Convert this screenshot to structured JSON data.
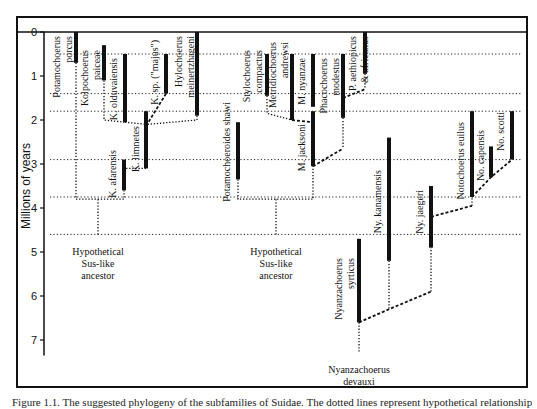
{
  "figure": {
    "caption": "Figure 1.1. The suggested phylogeny of the subfamilies of Suidae. The dotted lines represent hypothetical relationships; the solid bars represent known temporal ranges.",
    "y_axis": {
      "label": "Millions of years",
      "ticks": [
        0,
        1,
        2,
        3,
        4,
        5,
        6,
        7
      ],
      "range": [
        0,
        7.5
      ],
      "px_per_myr": 44,
      "y0_px": 32,
      "x_px": 44
    },
    "frame": {
      "left": 17,
      "top": 17,
      "right": 527,
      "bottom": 387,
      "inner_top": 32
    },
    "colors": {
      "ink": "#111111",
      "background": "#ffffff",
      "dotted": "#222222"
    },
    "reference_levels_myr": [
      0.5,
      1.4,
      1.8,
      2.9,
      3.75,
      4.6
    ],
    "taxa": [
      {
        "id": "potamochoerus-porcus",
        "label": [
          "Potamochoerus",
          "porcus"
        ],
        "x": 76,
        "start": 0.0,
        "end": 0.7,
        "label_x": 60,
        "label_y": 36
      },
      {
        "id": "kolpochoerus-paiceae",
        "label": [
          "Kolpochoerus",
          "paiceae"
        ],
        "x": 104,
        "start": 0.3,
        "end": 1.1,
        "label_x": 88,
        "label_y": 50
      },
      {
        "id": "k-olduvaiensis",
        "label": [
          "K. olduvaiensis"
        ],
        "x": 125,
        "start": 0.5,
        "end": 2.05,
        "label_x": 117,
        "label_y": 58
      },
      {
        "id": "k-sp-majus",
        "label": [
          "K. sp. (\"majus\")"
        ],
        "x": 166,
        "start": 0.5,
        "end": 1.4,
        "label_x": 158,
        "label_y": 40
      },
      {
        "id": "hylochoerus-meinertzhageni",
        "label": [
          "Hylochoerus",
          "meinertzhageni"
        ],
        "x": 197,
        "start": 0.0,
        "end": 1.9,
        "label_x": 182,
        "label_y": 36
      },
      {
        "id": "k-limnetes",
        "label": [
          "K. limnetes"
        ],
        "x": 146,
        "start": 1.8,
        "end": 3.1,
        "label_x": 139,
        "label_y": 126
      },
      {
        "id": "k-afarensis",
        "label": [
          "K. afarensis"
        ],
        "x": 124,
        "start": 2.9,
        "end": 3.6,
        "label_x": 116,
        "label_y": 150
      },
      {
        "id": "potamochoeroides-shawi",
        "label": [
          "Potamochoeroides shawi"
        ],
        "x": 238,
        "start": 2.05,
        "end": 3.35,
        "label_x": 230,
        "label_y": 102
      },
      {
        "id": "stylochoerus-compactus",
        "label": [
          "Stylochoerus",
          "compactus"
        ],
        "x": 267,
        "start": 0.5,
        "end": 1.45,
        "label_x": 250,
        "label_y": 50
      },
      {
        "id": "metridiochoerus-andrewsi",
        "label": [
          "Metridiochoerus",
          "andrewsi"
        ],
        "x": 292,
        "start": 0.5,
        "end": 2.0,
        "label_x": 276,
        "label_y": 42
      },
      {
        "id": "m-nyanzae",
        "label": [
          "M. nyanzae"
        ],
        "x": 313,
        "start": 0.5,
        "end": 1.7,
        "label_x": 305,
        "label_y": 58
      },
      {
        "id": "m-jacksoni",
        "label": [
          "M. jacksoni"
        ],
        "x": 313,
        "start": 1.8,
        "end": 3.05,
        "label_x": 305,
        "label_y": 124
      },
      {
        "id": "phacochoerus-modestus",
        "label": [
          "Phacochoerus",
          "modestus"
        ],
        "x": 343,
        "start": 0.5,
        "end": 1.95,
        "label_x": 327,
        "label_y": 58
      },
      {
        "id": "p-aethiopicus-africanus",
        "label": [
          "P. aethiopicus",
          "& africanus"
        ],
        "x": 365,
        "start": 0.0,
        "end": 0.95,
        "label_x": 356,
        "label_y": 36
      },
      {
        "id": "ny-kanamensis",
        "label": [
          "Ny. kanamensis"
        ],
        "x": 389,
        "start": 2.4,
        "end": 5.2,
        "label_x": 381,
        "label_y": 170
      },
      {
        "id": "ny-jaegeri",
        "label": [
          "Ny. jaegeri"
        ],
        "x": 431,
        "start": 3.5,
        "end": 4.9,
        "label_x": 423,
        "label_y": 190
      },
      {
        "id": "nyanzachoerus-syrticus",
        "label": [
          "Nyanzachoerus",
          "syrticus"
        ],
        "x": 359,
        "start": 4.7,
        "end": 6.6,
        "label_x": 342,
        "label_y": 258
      },
      {
        "id": "notochoerus-euilus",
        "label": [
          "Notochoerus euilus"
        ],
        "x": 472,
        "start": 1.8,
        "end": 3.75,
        "label_x": 464,
        "label_y": 122
      },
      {
        "id": "no-capensis",
        "label": [
          "No. capensis"
        ],
        "x": 491,
        "start": 2.6,
        "end": 3.3,
        "label_x": 484,
        "label_y": 130
      },
      {
        "id": "no-scotti",
        "label": [
          "No. scotti"
        ],
        "x": 512,
        "start": 1.8,
        "end": 2.9,
        "label_x": 504,
        "label_y": 112
      }
    ],
    "ancestors": [
      {
        "id": "sus-ancestor-left",
        "label": [
          "Hypothetical",
          "Sus-like",
          "ancestor"
        ],
        "x": 98,
        "y": 255
      },
      {
        "id": "sus-ancestor-middle",
        "label": [
          "Hypothetical",
          "Sus-like",
          "ancestor"
        ],
        "x": 276,
        "y": 255
      },
      {
        "id": "nyanzachoerus-devauxi",
        "label": [
          "Nyanzachoerus",
          "devauxi"
        ],
        "x": 359,
        "y": 373
      }
    ],
    "connectors": [
      {
        "type": "dotted",
        "points": [
          [
            76,
            0.7
          ],
          [
            76,
            3.8
          ]
        ]
      },
      {
        "type": "dotted",
        "points": [
          [
            76,
            3.8
          ],
          [
            124,
            3.8
          ],
          [
            124,
            3.6
          ]
        ]
      },
      {
        "type": "dotted",
        "points": [
          [
            98,
            3.8
          ],
          [
            98,
            4.6
          ]
        ]
      },
      {
        "type": "dotted",
        "points": [
          [
            104,
            1.1
          ],
          [
            104,
            2.0
          ],
          [
            125,
            2.05
          ]
        ]
      },
      {
        "type": "dotted",
        "points": [
          [
            125,
            2.05
          ],
          [
            147,
            2.1
          ]
        ]
      },
      {
        "type": "dashed",
        "points": [
          [
            166,
            1.4
          ],
          [
            147,
            2.1
          ]
        ]
      },
      {
        "type": "dotted",
        "points": [
          [
            197,
            1.9
          ],
          [
            197,
            2.0
          ],
          [
            147,
            2.1
          ]
        ]
      },
      {
        "type": "dotted",
        "points": [
          [
            146,
            3.1
          ],
          [
            124,
            3.1
          ],
          [
            124,
            2.9
          ]
        ]
      },
      {
        "type": "dotted",
        "points": [
          [
            238,
            3.35
          ],
          [
            238,
            3.8
          ],
          [
            313,
            3.8
          ],
          [
            313,
            3.05
          ]
        ]
      },
      {
        "type": "dotted",
        "points": [
          [
            276,
            3.8
          ],
          [
            276,
            4.6
          ]
        ]
      },
      {
        "type": "dotted",
        "points": [
          [
            267,
            1.45
          ],
          [
            267,
            1.85
          ],
          [
            292,
            2.0
          ]
        ]
      },
      {
        "type": "dashed",
        "points": [
          [
            292,
            2.0
          ],
          [
            313,
            2.05
          ]
        ]
      },
      {
        "type": "dashed",
        "points": [
          [
            313,
            3.05
          ],
          [
            343,
            2.65
          ]
        ]
      },
      {
        "type": "dotted",
        "points": [
          [
            343,
            1.95
          ],
          [
            343,
            2.65
          ]
        ]
      },
      {
        "type": "dotted",
        "points": [
          [
            365,
            0.95
          ],
          [
            365,
            1.3
          ]
        ]
      },
      {
        "type": "dashed",
        "points": [
          [
            343,
            1.5
          ],
          [
            365,
            1.3
          ]
        ]
      },
      {
        "type": "dotted",
        "points": [
          [
            389,
            5.2
          ],
          [
            389,
            6.3
          ]
        ]
      },
      {
        "type": "dashed",
        "points": [
          [
            359,
            6.6
          ],
          [
            389,
            6.3
          ],
          [
            431,
            5.9
          ]
        ]
      },
      {
        "type": "dotted",
        "points": [
          [
            431,
            5.9
          ],
          [
            431,
            4.9
          ]
        ]
      },
      {
        "type": "dotted",
        "points": [
          [
            359,
            6.6
          ],
          [
            359,
            7.3
          ]
        ]
      },
      {
        "type": "dashed",
        "points": [
          [
            431,
            4.2
          ],
          [
            472,
            3.95
          ]
        ]
      },
      {
        "type": "dotted",
        "points": [
          [
            472,
            3.95
          ],
          [
            472,
            3.75
          ]
        ]
      },
      {
        "type": "dashed",
        "points": [
          [
            472,
            3.75
          ],
          [
            491,
            3.3
          ],
          [
            512,
            2.9
          ]
        ]
      }
    ],
    "reference_line_spans": [
      {
        "level": 0.5,
        "x1": 60,
        "x2": 522
      },
      {
        "level": 1.4,
        "x1": 50,
        "x2": 522
      },
      {
        "level": 1.8,
        "x1": 50,
        "x2": 522
      },
      {
        "level": 2.9,
        "x1": 50,
        "x2": 522
      },
      {
        "level": 3.75,
        "x1": 50,
        "x2": 522
      },
      {
        "level": 4.6,
        "x1": 50,
        "x2": 522
      }
    ]
  }
}
